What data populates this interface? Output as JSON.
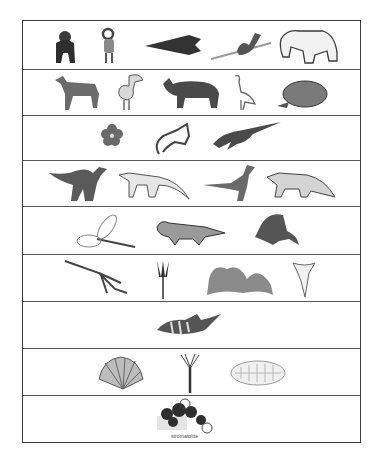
{
  "worksheet": {
    "rows": [
      {
        "items": [
          "gorilla",
          "bighorn sheep",
          "stone arrowhead",
          "spear thrower",
          "cave bear"
        ]
      },
      {
        "items": [
          "early horse",
          "terror bird",
          "brontothere",
          "heron",
          "giant tortoise"
        ]
      },
      {
        "items": [
          "flower",
          "early mammal",
          "plesiosaur"
        ]
      },
      {
        "items": [
          "iguanodon",
          "early dinosaur",
          "dilophosaurus",
          "aetosaur"
        ]
      },
      {
        "items": [
          "giant dragonfly",
          "eryops amphibian",
          "dimetrodon"
        ]
      },
      {
        "items": [
          "orthocone nautiloid",
          "crinoid",
          "coral",
          "shark tooth"
        ]
      },
      {
        "items": [
          "armored fish"
        ]
      },
      {
        "items": [
          "brachiopod shell",
          "burgess shale animal",
          "trilobite"
        ]
      },
      {
        "items": [
          "stromatolite"
        ],
        "caption": "stromatolite"
      }
    ]
  },
  "colors": {
    "border": "#3a3a3a",
    "ink_dark": "#2b2b2b",
    "ink_mid": "#6a6a6a",
    "ink_light": "#a8a8a8"
  }
}
